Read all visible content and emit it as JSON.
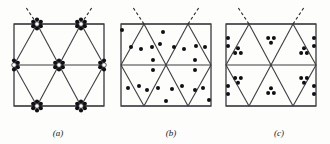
{
  "figure": {
    "caption_style": "italic-parenthetical",
    "background_color": "#fdfdfb",
    "ink_color": "#15161a",
    "frame_color": "#3a3a3c",
    "lattice_line_color": "#3d3d40",
    "dot_fill_color": "#101014",
    "open_dot_fill_color": "#ffffff",
    "dashed_line_color": "#2b2b2e",
    "panels": [
      {
        "id": "panel-a",
        "label": "(a)",
        "label_x": 58,
        "label_y": 136,
        "frame": {
          "x": 14,
          "y": 24,
          "width": 90,
          "height": 82
        },
        "motif": "rosette-clusters-at-vertices",
        "description": "Triangular net with six-dot rosette clusters centred on every lattice vertex",
        "dashed_lines": [
          {
            "x1": 37,
            "y1": 24,
            "x2": 25,
            "y2": 6
          },
          {
            "x1": 81,
            "y1": 24,
            "x2": 93,
            "y2": 6
          }
        ],
        "lattice": {
          "horizontal_lines": [
            {
              "x1": 14,
              "y1": 24,
              "x2": 104,
              "y2": 24
            },
            {
              "x1": 14,
              "y1": 65,
              "x2": 104,
              "y2": 65
            },
            {
              "x1": 14,
              "y1": 106,
              "x2": 104,
              "y2": 106
            }
          ],
          "diagonals": [
            {
              "x1": 14,
              "y1": 65,
              "x2": 37,
              "y2": 24
            },
            {
              "x1": 37,
              "y1": 24,
              "x2": 59,
              "y2": 65
            },
            {
              "x1": 59,
              "y1": 65,
              "x2": 81,
              "y2": 24
            },
            {
              "x1": 81,
              "y1": 24,
              "x2": 104,
              "y2": 65
            },
            {
              "x1": 14,
              "y1": 65,
              "x2": 37,
              "y2": 106
            },
            {
              "x1": 37,
              "y1": 106,
              "x2": 59,
              "y2": 65
            },
            {
              "x1": 59,
              "y1": 65,
              "x2": 81,
              "y2": 106
            },
            {
              "x1": 81,
              "y1": 106,
              "x2": 104,
              "y2": 65
            }
          ]
        },
        "clusters": [
          {
            "cx": 37,
            "cy": 24,
            "type": "full-rosette"
          },
          {
            "cx": 81,
            "cy": 24,
            "type": "full-rosette"
          },
          {
            "cx": 14,
            "cy": 65,
            "type": "half-rosette-right"
          },
          {
            "cx": 59,
            "cy": 65,
            "type": "full-rosette"
          },
          {
            "cx": 104,
            "cy": 65,
            "type": "half-rosette-left"
          },
          {
            "cx": 37,
            "cy": 106,
            "type": "full-rosette"
          },
          {
            "cx": 81,
            "cy": 106,
            "type": "full-rosette"
          }
        ],
        "cluster_ring_radius": 4.4,
        "cluster_dot_count": 6,
        "cluster_dot_radius": 2.1
      },
      {
        "id": "panel-b",
        "label": "(b)",
        "label_x": 171,
        "label_y": 136,
        "frame": {
          "x": 121,
          "y": 24,
          "width": 90,
          "height": 82
        },
        "motif": "scattered-single-dots",
        "description": "Same triangular net with individual dots scattered irregularly within the cells",
        "dashed_lines": [
          {
            "x1": 144,
            "y1": 24,
            "x2": 132,
            "y2": 6
          },
          {
            "x1": 188,
            "y1": 24,
            "x2": 200,
            "y2": 6
          }
        ],
        "lattice": {
          "horizontal_lines": [
            {
              "x1": 121,
              "y1": 24,
              "x2": 211,
              "y2": 24
            },
            {
              "x1": 121,
              "y1": 65,
              "x2": 211,
              "y2": 65
            },
            {
              "x1": 121,
              "y1": 106,
              "x2": 211,
              "y2": 106
            }
          ],
          "diagonals": [
            {
              "x1": 121,
              "y1": 65,
              "x2": 144,
              "y2": 24
            },
            {
              "x1": 144,
              "y1": 24,
              "x2": 166,
              "y2": 65
            },
            {
              "x1": 166,
              "y1": 65,
              "x2": 188,
              "y2": 24
            },
            {
              "x1": 188,
              "y1": 24,
              "x2": 211,
              "y2": 65
            },
            {
              "x1": 121,
              "y1": 65,
              "x2": 144,
              "y2": 106
            },
            {
              "x1": 144,
              "y1": 106,
              "x2": 166,
              "y2": 65
            },
            {
              "x1": 166,
              "y1": 65,
              "x2": 188,
              "y2": 106
            },
            {
              "x1": 188,
              "y1": 106,
              "x2": 211,
              "y2": 65
            }
          ]
        },
        "dot_radius": 2.0,
        "dots": [
          {
            "cx": 122,
            "cy": 30
          },
          {
            "cx": 163,
            "cy": 32
          },
          {
            "cx": 131,
            "cy": 47
          },
          {
            "cx": 141,
            "cy": 49
          },
          {
            "cx": 152,
            "cy": 47
          },
          {
            "cx": 160,
            "cy": 44
          },
          {
            "cx": 174,
            "cy": 47
          },
          {
            "cx": 184,
            "cy": 49
          },
          {
            "cx": 196,
            "cy": 46
          },
          {
            "cx": 205,
            "cy": 47
          },
          {
            "cx": 153,
            "cy": 60
          },
          {
            "cx": 153,
            "cy": 70
          },
          {
            "cx": 195,
            "cy": 60
          },
          {
            "cx": 195,
            "cy": 70
          },
          {
            "cx": 128,
            "cy": 88
          },
          {
            "cx": 139,
            "cy": 86
          },
          {
            "cx": 147,
            "cy": 90
          },
          {
            "cx": 158,
            "cy": 88
          },
          {
            "cx": 172,
            "cy": 89
          },
          {
            "cx": 182,
            "cy": 86
          },
          {
            "cx": 195,
            "cy": 90
          },
          {
            "cx": 203,
            "cy": 88
          },
          {
            "cx": 166,
            "cy": 101
          },
          {
            "cx": 209,
            "cy": 100
          }
        ]
      },
      {
        "id": "panel-c",
        "label": "(c)",
        "label_x": 279,
        "label_y": 136,
        "frame": {
          "x": 226,
          "y": 24,
          "width": 90,
          "height": 82
        },
        "motif": "triangular-triplets",
        "description": "Same triangular net with a compact three-dot triangular group centred in each triangle",
        "dashed_lines": [
          {
            "x1": 249,
            "y1": 24,
            "x2": 237,
            "y2": 6
          },
          {
            "x1": 293,
            "y1": 24,
            "x2": 305,
            "y2": 6
          }
        ],
        "lattice": {
          "horizontal_lines": [
            {
              "x1": 226,
              "y1": 24,
              "x2": 316,
              "y2": 24
            },
            {
              "x1": 226,
              "y1": 65,
              "x2": 316,
              "y2": 65
            },
            {
              "x1": 226,
              "y1": 106,
              "x2": 316,
              "y2": 106
            }
          ],
          "diagonals": [
            {
              "x1": 226,
              "y1": 65,
              "x2": 249,
              "y2": 24
            },
            {
              "x1": 249,
              "y1": 24,
              "x2": 271,
              "y2": 65
            },
            {
              "x1": 271,
              "y1": 65,
              "x2": 293,
              "y2": 24
            },
            {
              "x1": 293,
              "y1": 24,
              "x2": 316,
              "y2": 65
            },
            {
              "x1": 226,
              "y1": 65,
              "x2": 249,
              "y2": 106
            },
            {
              "x1": 249,
              "y1": 106,
              "x2": 271,
              "y2": 65
            },
            {
              "x1": 271,
              "y1": 65,
              "x2": 293,
              "y2": 106
            },
            {
              "x1": 293,
              "y1": 106,
              "x2": 316,
              "y2": 65
            }
          ]
        },
        "dot_radius": 2.0,
        "triplet_spacing": 4.6,
        "triplets": [
          {
            "cx": 238,
            "cy": 51,
            "orientation": "up"
          },
          {
            "cx": 271,
            "cy": 40,
            "orientation": "down"
          },
          {
            "cx": 304,
            "cy": 51,
            "orientation": "up"
          },
          {
            "cx": 238,
            "cy": 80,
            "orientation": "down"
          },
          {
            "cx": 271,
            "cy": 91,
            "orientation": "up"
          },
          {
            "cx": 304,
            "cy": 80,
            "orientation": "down"
          }
        ],
        "edge_dots": [
          {
            "cx": 228,
            "cy": 38
          },
          {
            "cx": 228,
            "cy": 46
          },
          {
            "cx": 314,
            "cy": 38
          },
          {
            "cx": 314,
            "cy": 46
          },
          {
            "cx": 228,
            "cy": 86
          },
          {
            "cx": 228,
            "cy": 94
          },
          {
            "cx": 314,
            "cy": 86
          },
          {
            "cx": 314,
            "cy": 94
          }
        ]
      }
    ]
  }
}
